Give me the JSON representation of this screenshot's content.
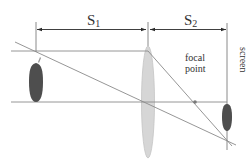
{
  "diagram": {
    "labels": {
      "s1": "S",
      "s1_sub": "1",
      "s2": "S",
      "s2_sub": "2",
      "focal_point": [
        "focal",
        "point"
      ],
      "screen": "screen"
    },
    "colors": {
      "ray": "#8a8a8a",
      "lens_fill": "#d6d6d6",
      "lens_stroke": "#c4c4c4",
      "object": "#4e4e4e",
      "text": "#333333",
      "dimension": "#2a2a2a"
    },
    "elements": [
      "object (upright)",
      "converging lens",
      "optical axis",
      "focal point",
      "screen",
      "inverted image"
    ]
  }
}
